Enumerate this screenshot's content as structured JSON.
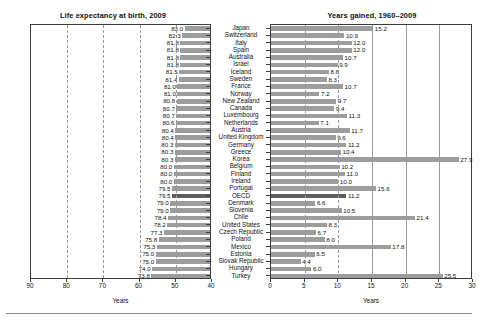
{
  "chart_data": {
    "type": "bar",
    "panels": [
      {
        "id": "life-expectancy",
        "title": "Life expectancy at birth, 2009",
        "xlabel": "Years",
        "ylabel": "",
        "direction": "reversed",
        "xlim": [
          90,
          40
        ],
        "ticks": [
          90,
          80,
          70,
          60,
          50,
          40
        ],
        "grid": true,
        "bar_color": "#9d9d9d",
        "highlight_color": "#5e5e5e"
      },
      {
        "id": "years-gained",
        "title": "Years gained, 1960–2009",
        "xlabel": "Years",
        "ylabel": "",
        "direction": "normal",
        "xlim": [
          0,
          30
        ],
        "ticks": [
          0,
          5,
          10,
          15,
          20,
          25,
          30
        ],
        "grid": true,
        "bar_color": "#9d9d9d",
        "highlight_color": "#5e5e5e"
      }
    ],
    "categories": [
      "Japan",
      "Switzerland",
      "Italy",
      "Spain",
      "Australia",
      "Israel",
      "Iceland",
      "Sweden",
      "France",
      "Norway",
      "New Zealand",
      "Canada",
      "Luxembourg",
      "Netherlands",
      "Austria",
      "United Kingdom",
      "Germany",
      "Greece",
      "Korea",
      "Belgium",
      "Finland",
      "Ireland",
      "Portugal",
      "OECD",
      "Denmark",
      "Slovenia",
      "Chile",
      "United States",
      "Czech Republic",
      "Poland",
      "Mexico",
      "Estonia",
      "Slovak Republic",
      "Hungary",
      "Turkey"
    ],
    "highlight_category": "OECD",
    "series": [
      {
        "name": "Life expectancy at birth, 2009",
        "panel": "life-expectancy",
        "values": [
          83.0,
          82.3,
          81.8,
          81.8,
          81.8,
          81.8,
          81.5,
          81.4,
          81.0,
          81.0,
          80.8,
          80.7,
          80.7,
          80.6,
          80.4,
          80.4,
          80.3,
          80.3,
          80.3,
          80.0,
          80.0,
          80.0,
          79.5,
          79.5,
          79.0,
          79.0,
          78.4,
          78.2,
          77.3,
          75.8,
          75.3,
          75.0,
          75.0,
          74.0,
          73.8
        ]
      },
      {
        "name": "Years gained, 1960–2009",
        "panel": "years-gained",
        "values": [
          15.2,
          10.9,
          12.0,
          12.0,
          10.7,
          9.9,
          8.6,
          8.3,
          10.7,
          7.2,
          9.7,
          9.4,
          11.3,
          7.1,
          11.7,
          9.6,
          11.2,
          10.4,
          27.9,
          10.2,
          11.0,
          10.0,
          15.6,
          11.2,
          6.6,
          10.5,
          21.4,
          8.3,
          6.7,
          8.0,
          17.8,
          6.5,
          4.4,
          6.0,
          25.5
        ]
      }
    ]
  }
}
